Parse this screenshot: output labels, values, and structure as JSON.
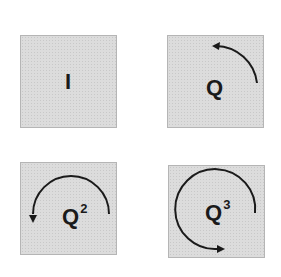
{
  "figure": {
    "panels": [
      {
        "id": "identity",
        "base": "I",
        "exponent": "",
        "rotation": "none"
      },
      {
        "id": "quarter-turn",
        "base": "Q",
        "exponent": "",
        "rotation": "90° counter-clockwise"
      },
      {
        "id": "half-turn",
        "base": "Q",
        "exponent": "2",
        "rotation": "180° counter-clockwise"
      },
      {
        "id": "three-quarter-turn",
        "base": "Q",
        "exponent": "3",
        "rotation": "270° counter-clockwise"
      }
    ],
    "colors": {
      "panel_fill": "#dcdcdc",
      "ink": "#1a1a1a"
    }
  }
}
